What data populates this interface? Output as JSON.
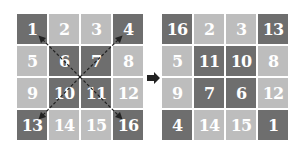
{
  "left_square": {
    "cells": [
      {
        "n": "1",
        "shade": "dark"
      },
      {
        "n": "2",
        "shade": "light"
      },
      {
        "n": "3",
        "shade": "light"
      },
      {
        "n": "4",
        "shade": "dark"
      },
      {
        "n": "5",
        "shade": "light"
      },
      {
        "n": "6",
        "shade": "dark"
      },
      {
        "n": "7",
        "shade": "dark"
      },
      {
        "n": "8",
        "shade": "light"
      },
      {
        "n": "9",
        "shade": "light"
      },
      {
        "n": "10",
        "shade": "dark"
      },
      {
        "n": "11",
        "shade": "dark"
      },
      {
        "n": "12",
        "shade": "light"
      },
      {
        "n": "13",
        "shade": "dark"
      },
      {
        "n": "14",
        "shade": "light"
      },
      {
        "n": "15",
        "shade": "light"
      },
      {
        "n": "16",
        "shade": "dark"
      }
    ]
  },
  "right_square": {
    "cells": [
      {
        "n": "16",
        "shade": "dark"
      },
      {
        "n": "2",
        "shade": "light"
      },
      {
        "n": "3",
        "shade": "light"
      },
      {
        "n": "13",
        "shade": "dark"
      },
      {
        "n": "5",
        "shade": "light"
      },
      {
        "n": "11",
        "shade": "dark"
      },
      {
        "n": "10",
        "shade": "dark"
      },
      {
        "n": "8",
        "shade": "light"
      },
      {
        "n": "9",
        "shade": "light"
      },
      {
        "n": "7",
        "shade": "dark"
      },
      {
        "n": "6",
        "shade": "dark"
      },
      {
        "n": "12",
        "shade": "light"
      },
      {
        "n": "4",
        "shade": "dark"
      },
      {
        "n": "14",
        "shade": "light"
      },
      {
        "n": "15",
        "shade": "light"
      },
      {
        "n": "1",
        "shade": "dark"
      }
    ]
  },
  "colors": {
    "dark": "#6e6e6e",
    "light": "#bdbdbd",
    "arrow": "#222222"
  }
}
